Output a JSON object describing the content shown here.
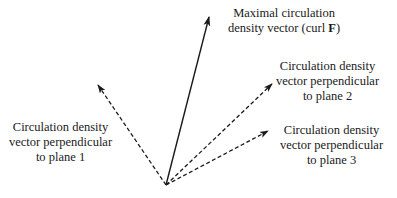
{
  "diagram": {
    "origin": {
      "x": 166,
      "y": 185
    },
    "vectors": [
      {
        "id": "curl",
        "tip": {
          "x": 209,
          "y": 17
        },
        "style": "solid",
        "label_lines": [
          "Maximal circulation",
          "density vector (curl F)"
        ]
      },
      {
        "id": "plane1",
        "tip": {
          "x": 98,
          "y": 85
        },
        "style": "dashed",
        "label_lines": [
          "Circulation density",
          "vector perpendicular",
          "to plane 1"
        ]
      },
      {
        "id": "plane2",
        "tip": {
          "x": 272,
          "y": 84
        },
        "style": "dashed",
        "label_lines": [
          "Circulation density",
          "vector perpendicular",
          "to plane 2"
        ]
      },
      {
        "id": "plane3",
        "tip": {
          "x": 268,
          "y": 131
        },
        "style": "dashed",
        "label_lines": [
          "Circulation density",
          "vector perpendicular",
          "to plane 3"
        ]
      }
    ]
  },
  "labels": {
    "curl": {
      "line1": "Maximal circulation",
      "line2_prefix": "density vector (curl ",
      "line2_bold": "F",
      "line2_suffix": ")"
    },
    "plane1": {
      "line1": "Circulation density",
      "line2": "vector perpendicular",
      "line3": "to plane 1"
    },
    "plane2": {
      "line1": "Circulation density",
      "line2": "vector perpendicular",
      "line3": "to plane 2"
    },
    "plane3": {
      "line1": "Circulation density",
      "line2": "vector perpendicular",
      "line3": "to plane 3"
    }
  },
  "colors": {
    "stroke": "#1a1a1a",
    "background": "#ffffff"
  }
}
